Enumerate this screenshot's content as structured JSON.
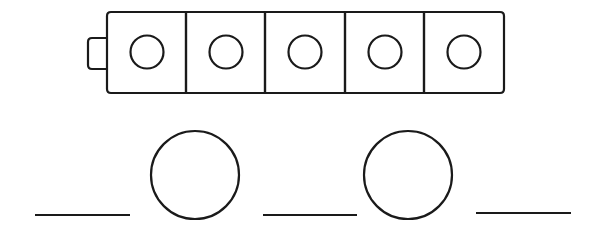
{
  "figure": {
    "colors": {
      "stroke": "#1a1a1a",
      "background": "#ffffff"
    },
    "block_train": {
      "block_count": 5,
      "has_connector_tab": true,
      "blocks": [
        {
          "index": 1,
          "shape": "circle"
        },
        {
          "index": 2,
          "shape": "circle"
        },
        {
          "index": 3,
          "shape": "circle"
        },
        {
          "index": 4,
          "shape": "circle"
        },
        {
          "index": 5,
          "shape": "circle"
        }
      ]
    },
    "answer_row": {
      "items": [
        {
          "type": "blank",
          "value": ""
        },
        {
          "type": "circle",
          "value": ""
        },
        {
          "type": "blank",
          "value": ""
        },
        {
          "type": "circle",
          "value": ""
        },
        {
          "type": "blank",
          "value": ""
        }
      ]
    }
  }
}
